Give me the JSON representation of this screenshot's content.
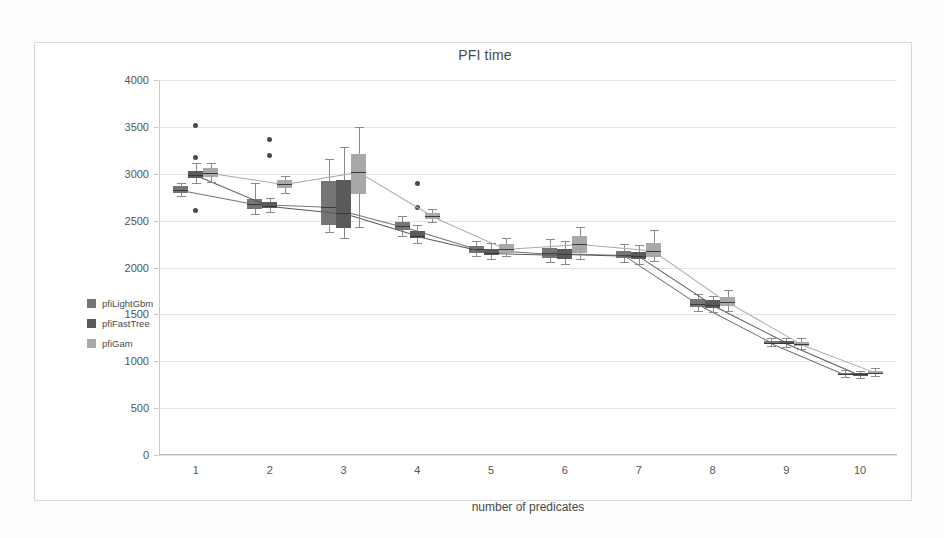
{
  "chart": {
    "title": "PFI time",
    "xlabel": "number of predicates",
    "ylabel": ""
  },
  "legend": {
    "position": "left",
    "items": [
      {
        "label": "pfiLightGbm",
        "color": "#757575"
      },
      {
        "label": "pfiFastTree",
        "color": "#5a5a5a"
      },
      {
        "label": "pfiGam",
        "color": "#a8a8a8"
      }
    ]
  },
  "axes": {
    "y_ticks": [
      "0",
      "500",
      "1000",
      "1500",
      "2000",
      "2500",
      "3000",
      "3500",
      "4000"
    ],
    "y_values": [
      0,
      500,
      1000,
      1500,
      2000,
      2500,
      3000,
      3500,
      4000
    ],
    "x_ticks": [
      "1",
      "2",
      "3",
      "4",
      "5",
      "6",
      "7",
      "8",
      "9",
      "10"
    ],
    "ylim": [
      0,
      4000
    ],
    "grid": true
  },
  "chart_data": {
    "type": "box",
    "title": "PFI time",
    "xlabel": "number of predicates",
    "ylabel": "",
    "ylim": [
      0,
      4000
    ],
    "grid": true,
    "categories": [
      "1",
      "2",
      "3",
      "4",
      "5",
      "6",
      "7",
      "8",
      "9",
      "10"
    ],
    "series": [
      {
        "name": "pfiLightGbm",
        "color": "#757575",
        "boxes": [
          {
            "x": "1",
            "whisker_low": 2760,
            "q1": 2790,
            "median": 2830,
            "q3": 2870,
            "whisker_high": 2900,
            "outliers": []
          },
          {
            "x": "2",
            "whisker_low": 2570,
            "q1": 2620,
            "median": 2680,
            "q3": 2730,
            "whisker_high": 2900,
            "outliers": []
          },
          {
            "x": "3",
            "whisker_low": 2380,
            "q1": 2450,
            "median": 2650,
            "q3": 2920,
            "whisker_high": 3160,
            "outliers": []
          },
          {
            "x": "4",
            "whisker_low": 2340,
            "q1": 2400,
            "median": 2440,
            "q3": 2490,
            "whisker_high": 2550,
            "outliers": []
          },
          {
            "x": "5",
            "whisker_low": 2120,
            "q1": 2160,
            "median": 2200,
            "q3": 2230,
            "whisker_high": 2280,
            "outliers": []
          },
          {
            "x": "6",
            "whisker_low": 2060,
            "q1": 2100,
            "median": 2150,
            "q3": 2210,
            "whisker_high": 2300,
            "outliers": []
          },
          {
            "x": "7",
            "whisker_low": 2060,
            "q1": 2100,
            "median": 2130,
            "q3": 2180,
            "whisker_high": 2250,
            "outliers": []
          },
          {
            "x": "8",
            "whisker_low": 1540,
            "q1": 1580,
            "median": 1610,
            "q3": 1660,
            "whisker_high": 1720,
            "outliers": []
          },
          {
            "x": "9",
            "whisker_low": 1160,
            "q1": 1180,
            "median": 1200,
            "q3": 1220,
            "whisker_high": 1250,
            "outliers": []
          },
          {
            "x": "10",
            "whisker_low": 830,
            "q1": 850,
            "median": 865,
            "q3": 880,
            "whisker_high": 905,
            "outliers": []
          }
        ]
      },
      {
        "name": "pfiFastTree",
        "color": "#5a5a5a",
        "boxes": [
          {
            "x": "1",
            "whisker_low": 2900,
            "q1": 2950,
            "median": 2990,
            "q3": 3030,
            "whisker_high": 3120,
            "outliers": [
              2610,
              3170,
              3510
            ]
          },
          {
            "x": "2",
            "whisker_low": 2590,
            "q1": 2630,
            "median": 2660,
            "q3": 2700,
            "whisker_high": 2740,
            "outliers": [
              3190,
              3370
            ]
          },
          {
            "x": "3",
            "whisker_low": 2320,
            "q1": 2420,
            "median": 2580,
            "q3": 2930,
            "whisker_high": 3290,
            "outliers": []
          },
          {
            "x": "4",
            "whisker_low": 2260,
            "q1": 2310,
            "median": 2340,
            "q3": 2390,
            "whisker_high": 2450,
            "outliers": [
              2640,
              2900
            ]
          },
          {
            "x": "5",
            "whisker_low": 2090,
            "q1": 2130,
            "median": 2160,
            "q3": 2200,
            "whisker_high": 2260,
            "outliers": []
          },
          {
            "x": "6",
            "whisker_low": 2040,
            "q1": 2090,
            "median": 2140,
            "q3": 2200,
            "whisker_high": 2280,
            "outliers": []
          },
          {
            "x": "7",
            "whisker_low": 2040,
            "q1": 2090,
            "median": 2120,
            "q3": 2170,
            "whisker_high": 2240,
            "outliers": []
          },
          {
            "x": "8",
            "whisker_low": 1530,
            "q1": 1570,
            "median": 1600,
            "q3": 1650,
            "whisker_high": 1700,
            "outliers": []
          },
          {
            "x": "9",
            "whisker_low": 1150,
            "q1": 1180,
            "median": 1200,
            "q3": 1220,
            "whisker_high": 1250,
            "outliers": []
          },
          {
            "x": "10",
            "whisker_low": 825,
            "q1": 845,
            "median": 860,
            "q3": 875,
            "whisker_high": 900,
            "outliers": []
          }
        ]
      },
      {
        "name": "pfiGam",
        "color": "#a8a8a8",
        "boxes": [
          {
            "x": "1",
            "whisker_low": 2910,
            "q1": 2970,
            "median": 3010,
            "q3": 3060,
            "whisker_high": 3110,
            "outliers": []
          },
          {
            "x": "2",
            "whisker_low": 2790,
            "q1": 2850,
            "median": 2890,
            "q3": 2930,
            "whisker_high": 2980,
            "outliers": []
          },
          {
            "x": "3",
            "whisker_low": 2430,
            "q1": 2780,
            "median": 3020,
            "q3": 3210,
            "whisker_high": 3500,
            "outliers": []
          },
          {
            "x": "4",
            "whisker_low": 2490,
            "q1": 2520,
            "median": 2550,
            "q3": 2580,
            "whisker_high": 2620,
            "outliers": []
          },
          {
            "x": "5",
            "whisker_low": 2120,
            "q1": 2160,
            "median": 2200,
            "q3": 2250,
            "whisker_high": 2310,
            "outliers": []
          },
          {
            "x": "6",
            "whisker_low": 2090,
            "q1": 2160,
            "median": 2250,
            "q3": 2340,
            "whisker_high": 2430,
            "outliers": []
          },
          {
            "x": "7",
            "whisker_low": 2070,
            "q1": 2110,
            "median": 2180,
            "q3": 2260,
            "whisker_high": 2400,
            "outliers": []
          },
          {
            "x": "8",
            "whisker_low": 1540,
            "q1": 1590,
            "median": 1630,
            "q3": 1690,
            "whisker_high": 1760,
            "outliers": []
          },
          {
            "x": "9",
            "whisker_low": 1130,
            "q1": 1160,
            "median": 1180,
            "q3": 1210,
            "whisker_high": 1250,
            "outliers": []
          },
          {
            "x": "10",
            "whisker_low": 840,
            "q1": 865,
            "median": 880,
            "q3": 895,
            "whisker_high": 930,
            "outliers": []
          }
        ]
      }
    ]
  }
}
